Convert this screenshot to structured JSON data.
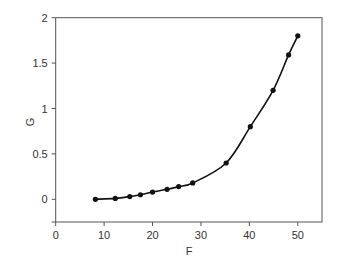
{
  "chart_data": {
    "type": "line",
    "title": "",
    "xlabel": "F",
    "ylabel": "G",
    "xlim": [
      0,
      55
    ],
    "ylim": [
      -0.25,
      2
    ],
    "xticks": [
      0,
      10,
      20,
      30,
      40,
      50
    ],
    "xtick_labels": [
      "0",
      "10",
      "20",
      "30",
      "40",
      "50"
    ],
    "yticks": [
      0,
      0.5,
      1,
      1.5,
      2
    ],
    "ytick_labels": [
      "0",
      "0.5",
      "1",
      "1.5",
      "2"
    ],
    "grid": false,
    "legend": null,
    "series": [
      {
        "name": "G vs F",
        "marker": "circle",
        "smooth": true,
        "color": "#111111",
        "x": [
          8.2,
          12.3,
          15.3,
          17.5,
          20.0,
          23.0,
          25.4,
          28.3,
          35.2,
          40.2,
          44.9,
          48.1,
          50.0
        ],
        "y": [
          0.0,
          0.01,
          0.03,
          0.05,
          0.08,
          0.11,
          0.14,
          0.18,
          0.4,
          0.8,
          1.2,
          1.59,
          1.8
        ]
      }
    ]
  },
  "colors": {
    "axis": "#555555",
    "line": "#111111",
    "text": "#333333"
  }
}
